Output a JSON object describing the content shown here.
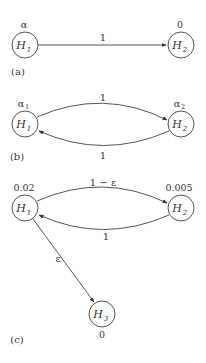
{
  "panels": [
    {
      "id": "a",
      "label": "(a)",
      "nodes": [
        {
          "name": "H",
          "sub": "1",
          "value": "α",
          "value_sub": ""
        },
        {
          "name": "H",
          "sub": "2",
          "value": "0",
          "value_sub": ""
        }
      ],
      "edges": [
        {
          "from": "H1",
          "to": "H2",
          "label": "1"
        }
      ]
    },
    {
      "id": "b",
      "label": "(b)",
      "nodes": [
        {
          "name": "H",
          "sub": "1",
          "value": "α",
          "value_sub": "1"
        },
        {
          "name": "H",
          "sub": "2",
          "value": "α",
          "value_sub": "2"
        }
      ],
      "edges": [
        {
          "from": "H1",
          "to": "H2",
          "label": "1"
        },
        {
          "from": "H2",
          "to": "H1",
          "label": "1"
        }
      ]
    },
    {
      "id": "c",
      "label": "(c)",
      "nodes": [
        {
          "name": "H",
          "sub": "1",
          "value": "0.02",
          "value_sub": ""
        },
        {
          "name": "H",
          "sub": "2",
          "value": "0.005",
          "value_sub": ""
        },
        {
          "name": "H",
          "sub": "3",
          "value": "0",
          "value_sub": ""
        }
      ],
      "edges": [
        {
          "from": "H1",
          "to": "H2",
          "label": "1 − ε"
        },
        {
          "from": "H2",
          "to": "H1",
          "label": "1"
        },
        {
          "from": "H1",
          "to": "H3",
          "label": "ε"
        }
      ]
    }
  ]
}
